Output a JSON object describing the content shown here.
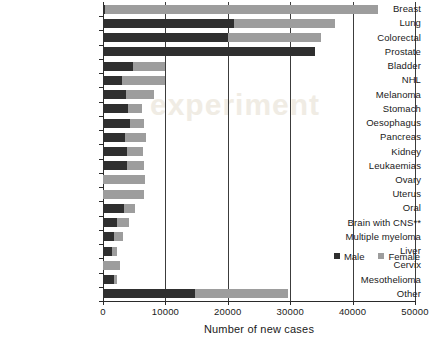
{
  "chart_data": {
    "type": "bar",
    "orientation": "horizontal",
    "stacked": true,
    "title": "",
    "xlabel": "Number of new cases",
    "ylabel": "",
    "xlim": [
      0,
      50000
    ],
    "xticks": [
      0,
      10000,
      20000,
      30000,
      40000,
      50000
    ],
    "xtick_labels": [
      "0",
      "10000",
      "20000",
      "30000",
      "40000",
      "50000"
    ],
    "grid": "vertical",
    "legend_position": "inside-right",
    "categories": [
      "Breast",
      "Lung",
      "Colorectal",
      "Prostate",
      "Bladder",
      "NHL",
      "Melanoma",
      "Stomach",
      "Oesophagus",
      "Pancreas",
      "Kidney",
      "Leukaemias",
      "Ovary",
      "Uterus",
      "Oral",
      "Brain with CNS**",
      "Multiple myeloma",
      "Liver",
      "Cervix",
      "Mesothelioma",
      "Other"
    ],
    "series": [
      {
        "name": "Male",
        "color": "#2f2f2f",
        "values": [
          300,
          21000,
          20000,
          34000,
          4800,
          3100,
          3700,
          4000,
          4300,
          3600,
          3900,
          3800,
          0,
          0,
          3300,
          2300,
          1800,
          1400,
          0,
          1800,
          14700
        ]
      },
      {
        "name": "Female",
        "color": "#9d9d9d",
        "values": [
          43700,
          16200,
          15000,
          0,
          5200,
          6900,
          4500,
          2300,
          2200,
          3300,
          2500,
          2800,
          6700,
          6600,
          1800,
          1800,
          1400,
          900,
          2700,
          400,
          14900
        ]
      }
    ],
    "totals": [
      44000,
      37200,
      35000,
      34000,
      10000,
      10000,
      8200,
      6300,
      6500,
      6900,
      6400,
      6600,
      6700,
      6600,
      5100,
      4100,
      3200,
      2300,
      2700,
      2200,
      29600
    ]
  },
  "legend": {
    "entries": [
      {
        "label": "Male",
        "color": "#2f2f2f"
      },
      {
        "label": "Female",
        "color": "#9d9d9d"
      }
    ]
  },
  "watermark": {
    "text": "experiment"
  }
}
